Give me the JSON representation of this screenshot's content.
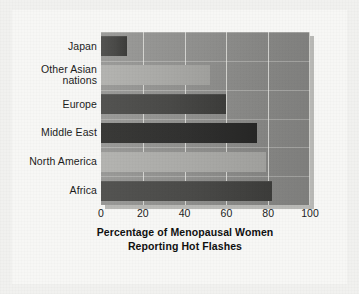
{
  "chart_data": {
    "type": "bar",
    "orientation": "horizontal",
    "title": "",
    "xlabel_lines": [
      "Percentage of Menopausal Women",
      "Reporting Hot Flashes"
    ],
    "xlabel": "Percentage of Menopausal Women Reporting Hot Flashes",
    "ylabel": "",
    "categories": [
      "Japan",
      "Other Asian nations",
      "Europe",
      "Middle East",
      "North America",
      "Africa"
    ],
    "category_label_lines": [
      [
        "Japan"
      ],
      [
        "Other Asian",
        "nations"
      ],
      [
        "Europe"
      ],
      [
        "Middle East"
      ],
      [
        "North America"
      ],
      [
        "Africa"
      ]
    ],
    "values": [
      12.5,
      52,
      60,
      74.5,
      79,
      82
    ],
    "bar_shades": [
      "dark",
      "light",
      "dark",
      "darkest",
      "light",
      "dark"
    ],
    "xlim": [
      0,
      100
    ],
    "xticks": [
      0,
      20,
      40,
      60,
      80,
      100
    ],
    "xtick_labels": [
      "0",
      "20",
      "40",
      "60",
      "80",
      "100"
    ],
    "grid": true,
    "grid_axis": "x",
    "legend": false,
    "legend_position": "none"
  },
  "style": {
    "page_background": "#f1f1ef",
    "panel_background": "#f7f7f5",
    "plot_background": "#8f8f8d",
    "gridline_color": "#e8e8e4",
    "bar_dark": "#4a4a48",
    "bar_darkest": "#313130",
    "bar_light": "#aaaaa7",
    "text_color": "#1c1c1c",
    "shadow_color": "#b9b9b6"
  }
}
